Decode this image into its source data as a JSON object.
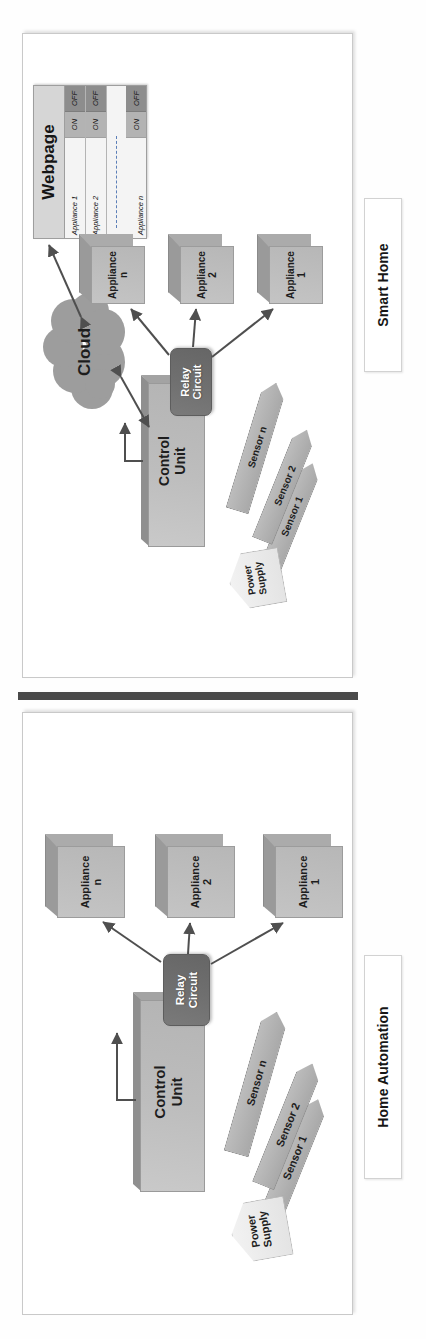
{
  "figure": {
    "type": "two-panel block diagram",
    "orientation": "rotated-90-ccw",
    "divider": "solid-dark-bar"
  },
  "panels": [
    {
      "id": "smart-home",
      "caption": "Smart Home",
      "nodes": {
        "cloud": "Cloud",
        "control_unit": "Control\nUnit",
        "relay": "Relay\nCircuit",
        "power_supply": "Power\nSupply"
      },
      "sensors": [
        {
          "label": "Sensor 1"
        },
        {
          "label": "Sensor 2"
        },
        {
          "label": "Sensor n"
        }
      ],
      "appliances": [
        {
          "label": "Appliance\n1"
        },
        {
          "label": "Appliance\n2"
        },
        {
          "label": "Appliance\nn"
        }
      ],
      "webpage": {
        "title": "Webpage",
        "rows": [
          {
            "name": "Appliance 1",
            "on": "ON",
            "off": "OFF"
          },
          {
            "name": "Appliance 2",
            "on": "ON",
            "off": "OFF"
          },
          {
            "name": "Appliance n",
            "on": "ON",
            "off": "OFF"
          }
        ],
        "separator": "dashed"
      }
    },
    {
      "id": "home-automation",
      "caption": "Home Automation",
      "nodes": {
        "control_unit": "Control\nUnit",
        "relay": "Relay\nCircuit",
        "power_supply": "Power\nSupply"
      },
      "sensors": [
        {
          "label": "Sensor 1"
        },
        {
          "label": "Sensor 2"
        },
        {
          "label": "Sensor n"
        }
      ],
      "appliances": [
        {
          "label": "Appliance\n1"
        },
        {
          "label": "Appliance\n2"
        },
        {
          "label": "Appliance\nn"
        }
      ]
    }
  ],
  "colors": {
    "panel_border": "#c9c9c9",
    "relay_fill": "#6f6f6f",
    "control_fill": "#bdbdbd",
    "cloud_fill": "#9d9d9d",
    "appliance_fill": "#bbbbbb",
    "sensor_fill": "#b0b0b0",
    "power_supply_fill": "#eeeeee",
    "webpage_on": "#b3b3b3",
    "webpage_off": "#8d8d8d",
    "divider": "#4a4a4a",
    "text": "#1c1c1c"
  }
}
